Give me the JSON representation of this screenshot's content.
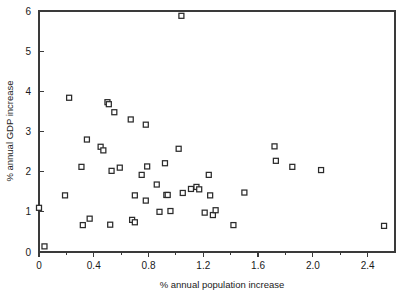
{
  "chart_data": {
    "type": "scatter",
    "title": "",
    "xlabel": "% annual population increase",
    "ylabel": "% annual GDP increase",
    "xlim": [
      0,
      2.6
    ],
    "ylim": [
      0,
      6
    ],
    "grid": false,
    "legend": null,
    "marker": "open-square",
    "xticks": [
      0,
      0.4,
      0.8,
      1.2,
      1.6,
      2.0,
      2.4
    ],
    "xticklabels": [
      "0",
      "0.4",
      "0.8",
      "1.2",
      "1.6",
      "2.0",
      "2.4"
    ],
    "xminorticks": [
      0.2,
      0.6,
      1.0,
      1.4,
      1.8,
      2.2
    ],
    "yticks": [
      0,
      1,
      2,
      3,
      4,
      5,
      6
    ],
    "yticklabels": [
      "0",
      "1",
      "2",
      "3",
      "4",
      "5",
      "6"
    ],
    "points": [
      [
        0.0,
        1.1
      ],
      [
        0.04,
        0.14
      ],
      [
        0.19,
        1.41
      ],
      [
        0.22,
        3.84
      ],
      [
        0.31,
        2.12
      ],
      [
        0.32,
        0.67
      ],
      [
        0.35,
        2.8
      ],
      [
        0.37,
        0.83
      ],
      [
        0.45,
        2.62
      ],
      [
        0.47,
        2.53
      ],
      [
        0.5,
        3.73
      ],
      [
        0.51,
        3.68
      ],
      [
        0.52,
        0.68
      ],
      [
        0.53,
        2.02
      ],
      [
        0.55,
        3.48
      ],
      [
        0.59,
        2.1
      ],
      [
        0.67,
        3.3
      ],
      [
        0.68,
        0.8
      ],
      [
        0.7,
        0.74
      ],
      [
        0.7,
        1.41
      ],
      [
        0.75,
        1.92
      ],
      [
        0.78,
        3.17
      ],
      [
        0.78,
        1.28
      ],
      [
        0.79,
        2.13
      ],
      [
        0.86,
        1.68
      ],
      [
        0.88,
        1.0
      ],
      [
        0.92,
        2.21
      ],
      [
        0.93,
        1.42
      ],
      [
        0.94,
        1.42
      ],
      [
        0.96,
        1.02
      ],
      [
        1.02,
        2.57
      ],
      [
        1.04,
        5.88
      ],
      [
        1.05,
        1.47
      ],
      [
        1.11,
        1.57
      ],
      [
        1.15,
        1.62
      ],
      [
        1.17,
        1.56
      ],
      [
        1.21,
        0.98
      ],
      [
        1.24,
        1.92
      ],
      [
        1.25,
        1.41
      ],
      [
        1.27,
        0.92
      ],
      [
        1.29,
        1.04
      ],
      [
        1.42,
        0.67
      ],
      [
        1.5,
        1.48
      ],
      [
        1.72,
        2.63
      ],
      [
        1.73,
        2.27
      ],
      [
        1.85,
        2.12
      ],
      [
        2.06,
        2.04
      ],
      [
        2.52,
        0.65
      ]
    ]
  },
  "figure": {
    "axis_color": "#3a3a3a",
    "marker_edge_color": "#2b2b2b",
    "marker_face_color": "#ffffff",
    "background": "#ffffff"
  }
}
